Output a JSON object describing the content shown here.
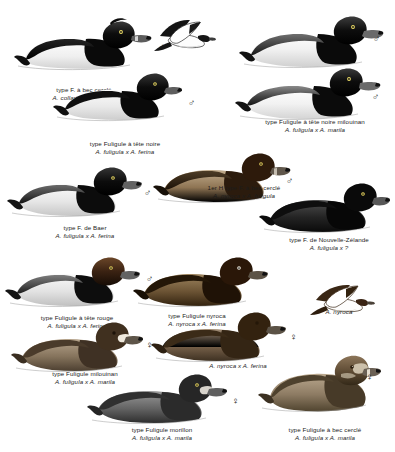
{
  "plate": {
    "title": "Aythya hybrid identification plate",
    "background_color": "#ffffff",
    "ink_color": "#111111"
  },
  "symbols": {
    "male": "♂",
    "female": "♀"
  },
  "figures": [
    {
      "id": "fig-1",
      "caption_fr": "type F. à bec cerclé",
      "caption_sci": "A. collaris x A. fuligula",
      "sex": "♂",
      "pose": "swimming",
      "head_color": "#101010",
      "body_color": "#f2f2f2"
    },
    {
      "id": "fig-2",
      "caption_fr": "",
      "caption_sci": "",
      "sex": "",
      "pose": "flying",
      "head_color": "#101010",
      "body_color": "#ffffff"
    },
    {
      "id": "fig-3",
      "caption_fr": "type Fuligule à tête noire",
      "caption_sci": "A. fuligula x A. ferina",
      "sex": "♂",
      "pose": "swimming",
      "head_color": "#101010",
      "body_color": "#e8e8e8"
    },
    {
      "id": "fig-4",
      "caption_fr": "type Fuligule à tête noire milouinan",
      "caption_sci": "A. fuligula x A. marila",
      "sex": "♂",
      "pose": "swimming-pair",
      "head_color": "#101010",
      "body_color": "#f0f0f0"
    },
    {
      "id": "fig-5",
      "caption_fr": "1er H type F. à bec cerclé",
      "caption_sci": "A. nyroca x A. fuligula",
      "sex": "♂",
      "pose": "swimming",
      "head_color": "#2a1508",
      "body_color": "#6b5338"
    },
    {
      "id": "fig-6",
      "caption_fr": "type F. de Baer",
      "caption_sci": "A. fuligula x A. ferina",
      "sex": "♂",
      "pose": "swimming",
      "head_color": "#141414",
      "body_color": "#ececec"
    },
    {
      "id": "fig-7",
      "caption_fr": "type F. de Nouvelle-Zélande",
      "caption_sci": "A. fuligula x ?",
      "sex": "♂",
      "pose": "swimming",
      "head_color": "#111111",
      "body_color": "#2e2e2e"
    },
    {
      "id": "fig-8",
      "caption_fr": "type Fuligule à tête rouge",
      "caption_sci": "A. fuligula x A. ferina",
      "sex": "♂",
      "pose": "swimming",
      "head_color": "#3a2112",
      "body_color": "#d8d8d8"
    },
    {
      "id": "fig-9",
      "caption_fr": "type Fuligule nyroca",
      "caption_sci": "A. nyroca x A. ferina",
      "sex": "♂",
      "pose": "swimming",
      "head_color": "#231309",
      "body_color": "#4a3venture"
    },
    {
      "id": "fig-10",
      "caption_fr": "",
      "caption_sci": "A. nyroca",
      "sex": "",
      "pose": "flying",
      "head_color": "#3a2414",
      "body_color": "#ffffff"
    },
    {
      "id": "fig-11",
      "caption_fr": "type Fuligule milouinan",
      "caption_sci": "A. fuligula x A. marila",
      "sex": "♀",
      "pose": "swimming",
      "head_color": "#3b2a1c",
      "body_color": "#8a7663"
    },
    {
      "id": "fig-12",
      "caption_fr": "",
      "caption_sci": "A. nyroca x A. ferina",
      "sex": "♀",
      "pose": "swimming",
      "head_color": "#2e1e12",
      "body_color": "#7a6550"
    },
    {
      "id": "fig-13",
      "caption_fr": "type Fuligule morillon",
      "caption_sci": "A. fuligula x A. marila",
      "sex": "♀",
      "pose": "swimming",
      "head_color": "#262626",
      "body_color": "#6e6e6e"
    },
    {
      "id": "fig-14",
      "caption_fr": "type Fuligule à bec cerclé",
      "caption_sci": "A. fuligula x A. marila",
      "sex": "♀",
      "pose": "swimming",
      "head_color": "#5a4733",
      "body_color": "#9b8a74"
    }
  ]
}
